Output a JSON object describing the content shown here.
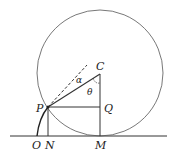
{
  "diagram": {
    "type": "cycloid-construction",
    "labels": {
      "C": "C",
      "P": "P",
      "Q": "Q",
      "O": "O",
      "N": "N",
      "M": "M",
      "alpha": "α",
      "theta": "θ"
    },
    "colors": {
      "stroke": "#333333",
      "background": "#ffffff"
    }
  }
}
